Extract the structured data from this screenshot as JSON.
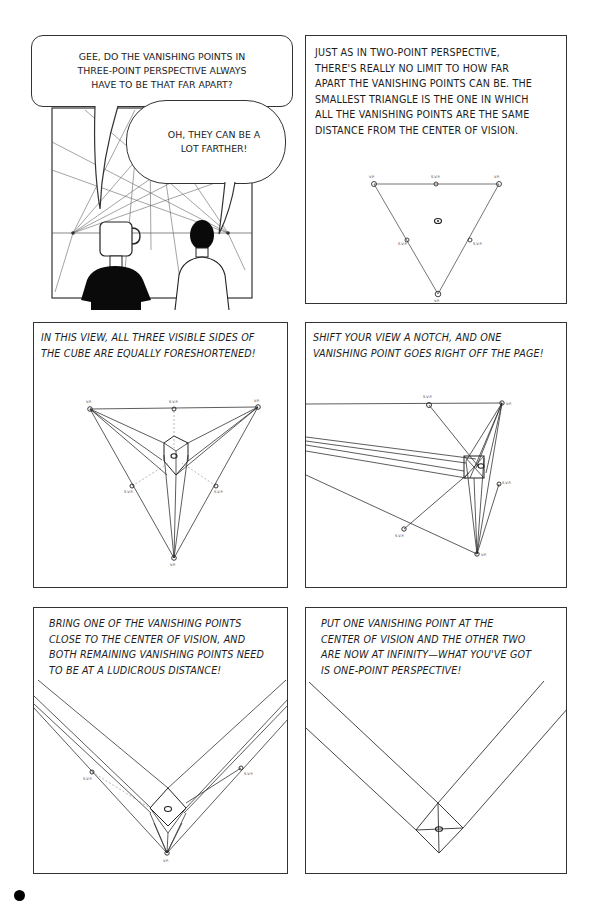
{
  "page": {
    "panels": [
      {
        "id": "panel-1",
        "type": "dialogue",
        "bubbles": [
          {
            "speaker": "mug-head",
            "lines": [
              "GEE, DO THE VANISHING POINTS IN",
              "THREE-POINT PERSPECTIVE ALWAYS",
              "HAVE TO BE THAT FAR APART?"
            ]
          },
          {
            "speaker": "man",
            "lines": [
              "OH, THEY CAN BE A",
              "LOT FARTHER!"
            ]
          }
        ]
      },
      {
        "id": "panel-2",
        "caption_lines": [
          "JUST AS IN TWO-POINT PERSPECTIVE,",
          "THERE'S REALLY NO LIMIT TO HOW FAR",
          "APART THE VANISHING POINTS CAN BE. THE",
          "SMALLEST TRIANGLE IS THE ONE IN WHICH",
          "ALL THE VANISHING POINTS ARE THE SAME",
          "DISTANCE FROM THE CENTER OF VISION."
        ],
        "labels": {
          "vp": "V.P.",
          "svp": "S.V.P."
        }
      },
      {
        "id": "panel-3",
        "caption_lines": [
          "IN THIS VIEW, ALL THREE VISIBLE SIDES OF",
          "THE CUBE ARE EQUALLY FORESHORTENED!"
        ],
        "labels": {
          "vp": "V.P.",
          "svp": "S.V.P."
        }
      },
      {
        "id": "panel-4",
        "caption_lines": [
          "SHIFT YOUR VIEW A NOTCH, AND ONE",
          "VANISHING POINT GOES RIGHT OFF THE PAGE!"
        ],
        "labels": {
          "vp": "V.P.",
          "svp": "S.V.P."
        }
      },
      {
        "id": "panel-5",
        "caption_lines": [
          "BRING ONE OF THE VANISHING POINTS",
          "CLOSE TO THE CENTER OF VISION, AND",
          "BOTH REMAINING VANISHING POINTS NEED",
          "TO BE AT A LUDICROUS DISTANCE!"
        ],
        "labels": {
          "vp": "V.P.",
          "svp": "S.V.P."
        }
      },
      {
        "id": "panel-6",
        "caption_lines": [
          "PUT ONE VANISHING POINT AT THE",
          "CENTER OF VISION AND THE OTHER TWO",
          "ARE NOW AT INFINITY—WHAT YOU'VE GOT",
          "IS ONE-POINT PERSPECTIVE!"
        ]
      }
    ],
    "colors": {
      "ink": "#1d1d1d",
      "line": "#555555",
      "paper": "#ffffff"
    }
  }
}
